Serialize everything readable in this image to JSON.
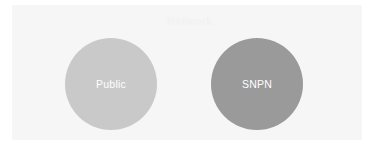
{
  "panel": {
    "title": "Network",
    "background_color": "#f6f6f6"
  },
  "nodes": [
    {
      "id": "public",
      "label": "Public",
      "fill_color": "#c9c9c9",
      "text_color": "#ffffff",
      "shape": "circle",
      "center_x": 111,
      "center_y": 84,
      "diameter": 92
    },
    {
      "id": "snpn",
      "label": "SNPN",
      "fill_color": "#9a9a9a",
      "text_color": "#ffffff",
      "shape": "circle",
      "center_x": 257,
      "center_y": 84,
      "diameter": 92
    }
  ]
}
